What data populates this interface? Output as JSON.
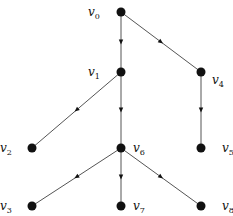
{
  "diagram": {
    "type": "directed-tree",
    "colors": {
      "node": "#111111",
      "edge": "#555555",
      "background": "#ffffff"
    },
    "nodes": [
      {
        "id": "v0",
        "base": "v",
        "sub": "0",
        "x": 121,
        "y": 12,
        "lx": 88,
        "ly": 16
      },
      {
        "id": "v1",
        "base": "v",
        "sub": "1",
        "x": 121,
        "y": 72,
        "lx": 88,
        "ly": 76
      },
      {
        "id": "v4",
        "base": "v",
        "sub": "4",
        "x": 201,
        "y": 72,
        "lx": 212,
        "ly": 84
      },
      {
        "id": "v2",
        "base": "v",
        "sub": "2",
        "x": 32,
        "y": 148,
        "lx": 0,
        "ly": 152
      },
      {
        "id": "v6",
        "base": "v",
        "sub": "6",
        "x": 121,
        "y": 148,
        "lx": 133,
        "ly": 152
      },
      {
        "id": "v5",
        "base": "v",
        "sub": "5",
        "x": 201,
        "y": 148,
        "lx": 222,
        "ly": 152
      },
      {
        "id": "v3",
        "base": "v",
        "sub": "3",
        "x": 32,
        "y": 206,
        "lx": 0,
        "ly": 210
      },
      {
        "id": "v7",
        "base": "v",
        "sub": "7",
        "x": 121,
        "y": 206,
        "lx": 133,
        "ly": 210
      },
      {
        "id": "v8",
        "base": "v",
        "sub": "8",
        "x": 201,
        "y": 206,
        "lx": 222,
        "ly": 210
      }
    ],
    "edges": [
      {
        "from": "v0",
        "to": "v1"
      },
      {
        "from": "v0",
        "to": "v4"
      },
      {
        "from": "v1",
        "to": "v2"
      },
      {
        "from": "v1",
        "to": "v6"
      },
      {
        "from": "v4",
        "to": "v5"
      },
      {
        "from": "v6",
        "to": "v3"
      },
      {
        "from": "v6",
        "to": "v7"
      },
      {
        "from": "v6",
        "to": "v8"
      }
    ]
  }
}
